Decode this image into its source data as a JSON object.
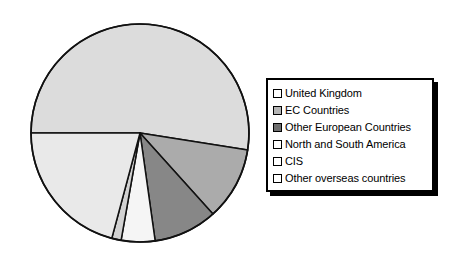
{
  "chart_data": {
    "type": "pie",
    "title": "",
    "subtitle": "",
    "xlabel": "",
    "ylabel": "",
    "legend_position": "right",
    "grid": false,
    "start_angle_deg": 180,
    "direction": "clockwise",
    "categories": [
      "United Kingdom",
      "EC Countries",
      "Other European Countries",
      "North and South America",
      "CIS",
      "Other overseas countries"
    ],
    "values": [
      51,
      11,
      9.5,
      22,
      1.5,
      5
    ],
    "units": "percent",
    "slices": [
      {
        "label": "United Kingdom",
        "value": 51,
        "color": "#dcdcdc",
        "start_deg": 270,
        "end_deg": 99
      },
      {
        "label": "EC Countries",
        "value": 11,
        "color": "#ababab",
        "start_deg": 99,
        "end_deg": 138
      },
      {
        "label": "Other European Countries",
        "value": 9.5,
        "color": "#878787",
        "start_deg": 138,
        "end_deg": 172
      },
      {
        "label": "Other overseas countries",
        "value": 5,
        "color": "#f5f5f5",
        "start_deg": 172,
        "end_deg": 190
      },
      {
        "label": "CIS",
        "value": 1.5,
        "color": "#d2d2d2",
        "start_deg": 190,
        "end_deg": 195
      },
      {
        "label": "North and South America",
        "value": 22,
        "color": "#e9e9e9",
        "start_deg": 195,
        "end_deg": 270
      }
    ]
  },
  "legend": {
    "items": [
      {
        "label": "United Kingdom",
        "color": "#ffffff"
      },
      {
        "label": "EC Countries",
        "color": "#b5b5b5"
      },
      {
        "label": "Other European Countries",
        "color": "#6e6e6e"
      },
      {
        "label": "North and South America",
        "color": "#ffffff"
      },
      {
        "label": "CIS",
        "color": "#ffffff"
      },
      {
        "label": "Other overseas countries",
        "color": "#ffffff"
      }
    ]
  },
  "style": {
    "outline_color": "#111111",
    "background": "#ffffff"
  }
}
